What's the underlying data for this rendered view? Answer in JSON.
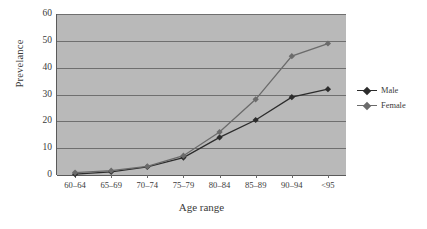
{
  "chart_data": {
    "type": "line",
    "title": "",
    "xlabel": "Age range",
    "ylabel": "Prevelance",
    "categories": [
      "60–64",
      "65–69",
      "70–74",
      "75–79",
      "80–84",
      "85–89",
      "90–94",
      "<95"
    ],
    "ylim": [
      0,
      60
    ],
    "yticks": [
      0,
      10,
      20,
      30,
      40,
      50,
      60
    ],
    "grid": true,
    "legend_position": "right",
    "series": [
      {
        "name": "Male",
        "color": "#2c2c2c",
        "marker": "diamond",
        "values": [
          0.3,
          1.2,
          3.0,
          6.5,
          14.0,
          20.5,
          29.0,
          32.0
        ]
      },
      {
        "name": "Female",
        "color": "#6b6b6b",
        "marker": "diamond",
        "values": [
          0.9,
          1.6,
          3.2,
          7.2,
          16.0,
          28.2,
          44.3,
          49.0
        ]
      }
    ],
    "plot_background": "#b9b9b9",
    "gridline_color": "#6f6f6f",
    "axis_color": "#5a5a5a"
  },
  "legend": {
    "items": [
      {
        "label": "Male"
      },
      {
        "label": "Female"
      }
    ]
  }
}
